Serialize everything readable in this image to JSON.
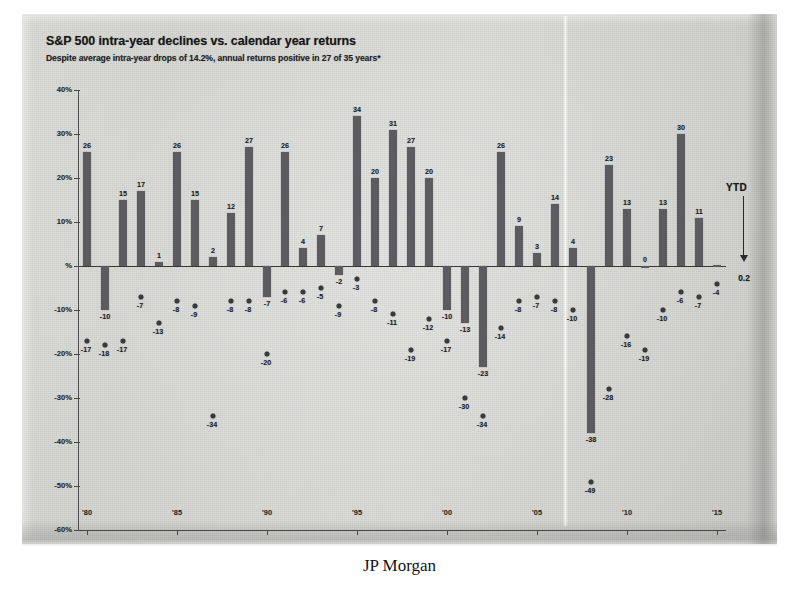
{
  "chart_data": {
    "type": "bar",
    "title": "S&P 500 intra-year declines vs. calendar year returns",
    "subtitle": "Despite average intra-year drops of 14.2%, annual returns positive in 27 of 35 years*",
    "xlabel": "",
    "ylabel": "",
    "ylim": [
      -60,
      40
    ],
    "ytick_labels": [
      "40%",
      "30%",
      "20%",
      "10%",
      "%",
      "-10%",
      "-20%",
      "-30%",
      "-40%",
      "-50%",
      "-60%"
    ],
    "ytick_values": [
      40,
      30,
      20,
      10,
      0,
      -10,
      -20,
      -30,
      -40,
      -50,
      -60
    ],
    "xtick_labels": [
      "'80",
      "'85",
      "'90",
      "'95",
      "'00",
      "'05",
      "'10",
      "'15"
    ],
    "xtick_years": [
      1980,
      1985,
      1990,
      1995,
      2000,
      2005,
      2010,
      2015
    ],
    "grid": false,
    "legend": "none",
    "categories": [
      1980,
      1981,
      1982,
      1983,
      1984,
      1985,
      1986,
      1987,
      1988,
      1989,
      1990,
      1991,
      1992,
      1993,
      1994,
      1995,
      1996,
      1997,
      1998,
      1999,
      2000,
      2001,
      2002,
      2003,
      2004,
      2005,
      2006,
      2007,
      2008,
      2009,
      2010,
      2011,
      2012,
      2013,
      2014,
      2015
    ],
    "series": [
      {
        "name": "Calendar year return (%)",
        "type": "bar",
        "values": [
          26,
          -10,
          15,
          17,
          1,
          26,
          15,
          2,
          12,
          27,
          -7,
          26,
          4,
          7,
          -2,
          34,
          20,
          31,
          27,
          20,
          -10,
          -13,
          -23,
          26,
          9,
          3,
          14,
          4,
          -38,
          23,
          13,
          0,
          13,
          30,
          11,
          0.2
        ]
      },
      {
        "name": "Max intra-year decline (%)",
        "type": "scatter",
        "values": [
          -17,
          -18,
          -17,
          -7,
          -13,
          -8,
          -9,
          -34,
          -8,
          -8,
          -20,
          -6,
          -6,
          -5,
          -9,
          -3,
          -8,
          -11,
          -19,
          -12,
          -17,
          -30,
          -34,
          -14,
          -8,
          -7,
          -8,
          -10,
          -49,
          -28,
          -16,
          -19,
          -10,
          -6,
          -7,
          -4
        ]
      }
    ],
    "annotation": {
      "ytd_label": "YTD",
      "ytd_value": "0.2"
    },
    "source_caption": "JP Morgan"
  }
}
